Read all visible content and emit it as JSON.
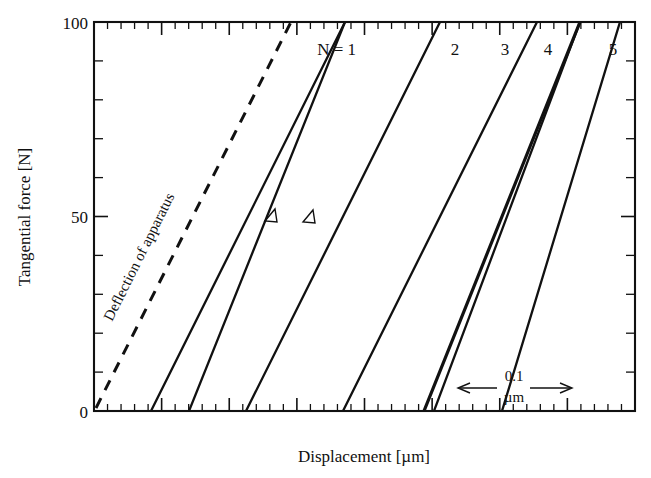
{
  "chart_data": {
    "type": "line",
    "title": "",
    "xlabel": "Displacement [µm]",
    "ylabel": "Tangential force [N]",
    "ylim": [
      0,
      100
    ],
    "ytick_labels": [
      "0",
      "50",
      "100"
    ],
    "ytick_values": [
      0,
      50,
      100
    ],
    "y_minor_step": 10,
    "xlim_note": "x axis unlabeled; tick spacing only",
    "x_major_ticks": 8,
    "x_minor_per_major": 5,
    "grid": false,
    "legend": "none",
    "scale_bar": {
      "value": "0.1",
      "unit": "µm",
      "style": "double-headed-arrow"
    },
    "annotations": [
      {
        "text": "Deflection of apparatus",
        "style": "dashed-line-label",
        "rotated": true
      },
      {
        "text": "N = 1",
        "style": "curve-label"
      },
      {
        "text": "2",
        "style": "curve-label"
      },
      {
        "text": "3",
        "style": "curve-label"
      },
      {
        "text": "4",
        "style": "curve-label"
      },
      {
        "text": "5",
        "style": "curve-label"
      }
    ],
    "series": [
      {
        "name": "Deflection of apparatus",
        "linestyle": "dashed",
        "x": [
          0.0,
          1.0
        ],
        "y": [
          0,
          100
        ]
      },
      {
        "name": "N = 1",
        "linestyle": "solid",
        "hysteresis": true,
        "loading_x": [
          0.42,
          1.38
        ],
        "loading_y": [
          0,
          100
        ],
        "unloading_x": [
          0.7,
          1.38
        ],
        "unloading_y": [
          0,
          100
        ],
        "arrow_at_force": 50
      },
      {
        "name": "2",
        "linestyle": "solid",
        "hysteresis": false,
        "loading_x": [
          1.18,
          2.14
        ],
        "loading_y": [
          0,
          100
        ]
      },
      {
        "name": "3",
        "linestyle": "solid",
        "hysteresis": false,
        "loading_x": [
          1.9,
          2.86
        ],
        "loading_y": [
          0,
          100
        ]
      },
      {
        "name": "4",
        "linestyle": "solid",
        "hysteresis": true,
        "loading_x": [
          2.52,
          3.46
        ],
        "loading_y": [
          0,
          100
        ],
        "unloading_x": [
          2.6,
          3.46
        ],
        "unloading_y": [
          0,
          100
        ]
      },
      {
        "name": "5",
        "linestyle": "solid",
        "hysteresis": false,
        "loading_x": [
          3.1,
          4.06
        ],
        "loading_y": [
          0,
          100
        ]
      }
    ]
  },
  "axes": {
    "y_label": "Tangential force [N]",
    "x_label": "Displacement [µm]",
    "y_ticks": [
      {
        "value": 100,
        "label": "100"
      },
      {
        "value": 50,
        "label": "50"
      },
      {
        "value": 0,
        "label": "0"
      }
    ]
  },
  "labels": {
    "deflection": "Deflection of apparatus",
    "n1": "N = 1",
    "n2": "2",
    "n3": "3",
    "n4": "4",
    "n5": "5",
    "scale_value": "0.1",
    "scale_unit": "µm"
  },
  "colors": {
    "ink": "#111111",
    "paper": "#ffffff"
  }
}
